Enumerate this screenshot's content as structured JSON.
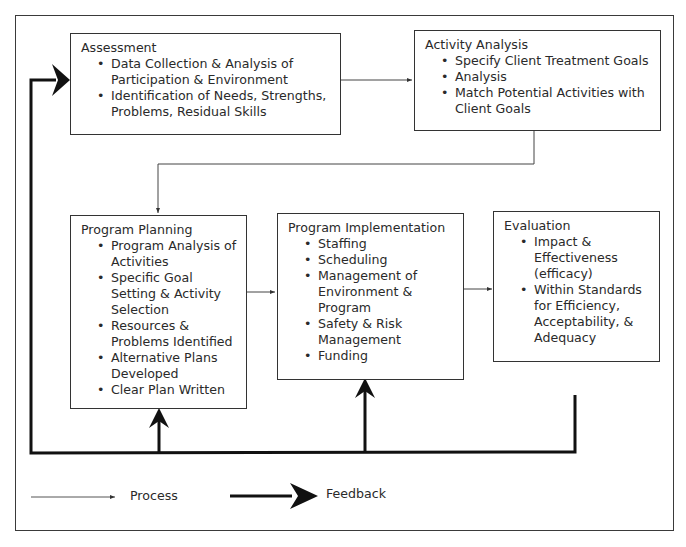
{
  "diagram": {
    "boxes": {
      "assessment": {
        "title": "Assessment",
        "items": [
          "Data Collection & Analysis of Participation & Environment",
          "Identification of Needs, Strengths, Problems, Residual Skills"
        ]
      },
      "activity_analysis": {
        "title": "Activity Analysis",
        "items": [
          "Specify Client Treatment Goals",
          "Analysis",
          "Match Potential Activities with Client Goals"
        ]
      },
      "program_planning": {
        "title": "Program Planning",
        "items": [
          "Program Analysis of Activities",
          "Specific Goal Setting & Activity Selection",
          "Resources & Problems Identified",
          "Alternative Plans Developed",
          "Clear Plan Written"
        ]
      },
      "program_implementation": {
        "title": "Program Implementation",
        "items": [
          "Staffing",
          "Scheduling",
          "Management of Environment & Program",
          "Safety & Risk Management",
          "Funding"
        ]
      },
      "evaluation": {
        "title": "Evaluation",
        "items": [
          "Impact & Effectiveness (efficacy)",
          "Within Standards for Efficiency, Acceptability, & Adequacy"
        ]
      }
    },
    "legend": {
      "process_label": "Process",
      "feedback_label": "Feedback"
    },
    "colors": {
      "line": "#333333",
      "text": "#2a2a2a"
    }
  }
}
